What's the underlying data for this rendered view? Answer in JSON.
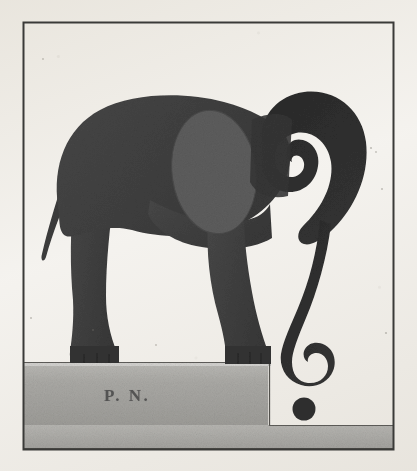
{
  "artwork": {
    "title": "Elephant Question Mark",
    "medium": "halftone print illustration",
    "signature": "P. N.",
    "background_color": "#f4f2ee",
    "frame_color": "#3a3a38"
  },
  "figure": {
    "pose": "standing on pedestal, head lowered, trunk curled into question-mark shape",
    "body_color": "#414141",
    "head_color": "#2b2b2b",
    "ear_color": "#5c5c5c",
    "tail_label": "tail",
    "ear_label": "ear",
    "trunk_label": "trunk",
    "head_label": "head",
    "foreleg_label": "foreleg",
    "hindleg_label": "hindleg",
    "body_label": "body"
  },
  "pedestal": {
    "color": "#a9a8a4",
    "top_highlight_color": "#cfcecb",
    "shadow_color": "#8f8e8a",
    "ground_strip_color": "#b0afab",
    "label": "pedestal"
  },
  "punctuation_dot": {
    "color": "#2f2f2f",
    "label": "question-mark-dot",
    "diameter_px": 23
  },
  "frame": {
    "left": 23,
    "top": 22,
    "right": 394,
    "bottom": 450,
    "stroke_width": 2
  }
}
